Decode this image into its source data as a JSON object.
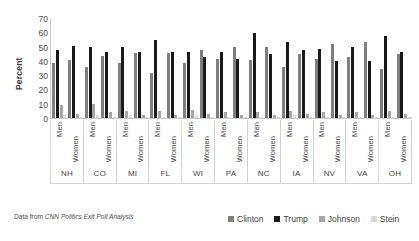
{
  "caption": {
    "prefix": "Data from ",
    "source": "CNN Politics Exit Poll Analysis"
  },
  "legend": {
    "position": "bottom-right",
    "items": [
      {
        "label": "Clinton",
        "color": "#7f7f7f",
        "icon": "square-swatch-icon"
      },
      {
        "label": "Trump",
        "color": "#1a1a1a",
        "icon": "square-swatch-icon"
      },
      {
        "label": "Johnson",
        "color": "#a6a6a6",
        "icon": "square-swatch-icon"
      },
      {
        "label": "Stein",
        "color": "#d9d9d9",
        "icon": "square-swatch-icon"
      }
    ]
  },
  "chart_data": {
    "type": "bar",
    "title": "",
    "xlabel": "",
    "ylabel": "Percent",
    "ylim": [
      0,
      70
    ],
    "yticks": [
      70,
      60,
      50,
      40,
      30,
      20,
      10,
      0
    ],
    "grid": false,
    "legend_position": "bottom-right",
    "group_labels": [
      "NH",
      "CO",
      "MI",
      "FL",
      "WI",
      "PA",
      "NC",
      "IA",
      "NV",
      "VA",
      "OH"
    ],
    "subgroup_labels": [
      "Men",
      "Women"
    ],
    "categories": [
      "NH Men",
      "NH Women",
      "CO Men",
      "CO Women",
      "MI Men",
      "MI Women",
      "FL Men",
      "FL Women",
      "WI Men",
      "WI Women",
      "PA Men",
      "PA Women",
      "NC Men",
      "NC Women",
      "IA Men",
      "IA Women",
      "NV Men",
      "NV Women",
      "VA Men",
      "VA Women",
      "OH Men",
      "OH Women"
    ],
    "series": [
      {
        "name": "Clinton",
        "color": "#7f7f7f",
        "values": [
          39,
          41,
          36,
          44,
          39,
          46,
          32,
          46,
          39,
          48,
          42,
          50,
          41,
          50,
          36,
          45,
          42,
          52,
          43,
          54,
          35,
          45
        ]
      },
      {
        "name": "Trump",
        "color": "#1a1a1a",
        "values": [
          48,
          51,
          50,
          47,
          50,
          47,
          55,
          47,
          47,
          43,
          47,
          42,
          60,
          45,
          54,
          48,
          49,
          40,
          50,
          40,
          58,
          47
        ]
      },
      {
        "name": "Johnson",
        "color": "#a6a6a6",
        "values": [
          9,
          3,
          10,
          4,
          5,
          2,
          5,
          2,
          6,
          3,
          4,
          2,
          4,
          2,
          5,
          3,
          4,
          2,
          4,
          2,
          5,
          3
        ]
      },
      {
        "name": "Stein",
        "color": "#d9d9d9",
        "values": [
          2,
          1,
          2,
          1,
          2,
          1,
          1,
          1,
          2,
          1,
          1,
          1,
          1,
          1,
          2,
          1,
          1,
          1,
          1,
          1,
          1,
          1
        ]
      }
    ]
  }
}
